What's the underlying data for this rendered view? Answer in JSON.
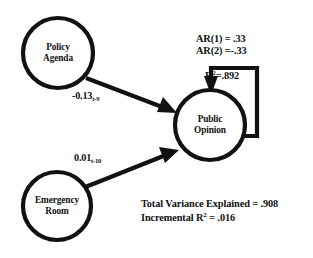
{
  "diagram": {
    "type": "path-diagram",
    "nodes": [
      {
        "id": "policy-agenda",
        "label_lines": [
          "Policy",
          "Agenda"
        ],
        "cx": 58,
        "cy": 53,
        "r": 35
      },
      {
        "id": "public-opinion",
        "label_lines": [
          "Public",
          "Opinion"
        ],
        "cx": 210,
        "cy": 125,
        "r": 35
      },
      {
        "id": "emergency-room",
        "label_lines": [
          "Emergency",
          "Room"
        ],
        "cx": 57,
        "cy": 206,
        "r": 34
      }
    ],
    "edges": [
      {
        "id": "policy-to-opinion",
        "from": "policy-agenda",
        "to": "public-opinion",
        "coefficient": "-0.13",
        "lag": "t-9"
      },
      {
        "id": "emergency-to-opinion",
        "from": "emergency-room",
        "to": "public-opinion",
        "coefficient": "0.01",
        "lag": "t-10"
      },
      {
        "id": "opinion-self-loop",
        "from": "public-opinion",
        "to": "public-opinion",
        "autoregressive": true
      }
    ],
    "annotations": {
      "ar1": "AR(1) = .33",
      "ar2": "AR(2) =-.33",
      "r_squared_prefix": "R",
      "r_squared_exp": "2",
      "r_squared_value": "=.892",
      "total_variance": "Total Variance Explained = .908",
      "incremental_prefix": "Incremental R",
      "incremental_exp": "2",
      "incremental_value": " = .016"
    },
    "colors": {
      "stroke": "#111111",
      "background": "#ffffff",
      "text": "#111111"
    }
  }
}
